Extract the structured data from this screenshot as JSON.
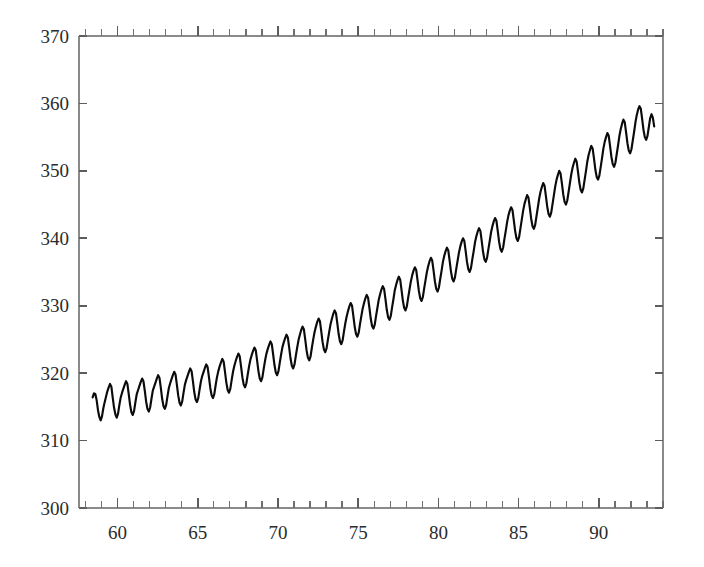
{
  "chart_data": {
    "type": "line",
    "title": "",
    "subtitle": "",
    "xlabel": "",
    "ylabel": "",
    "xlim": [
      57.6,
      94.0
    ],
    "ylim": [
      300,
      370
    ],
    "grid": false,
    "legend": null,
    "x_tick_labels": [
      "60",
      "65",
      "70",
      "75",
      "80",
      "85",
      "90"
    ],
    "x_tick_values": [
      60,
      65,
      70,
      75,
      80,
      85,
      90
    ],
    "x_minor_tick_step": 1,
    "y_tick_labels": [
      "300",
      "310",
      "320",
      "330",
      "340",
      "350",
      "360",
      "370"
    ],
    "y_tick_values": [
      300,
      310,
      320,
      330,
      340,
      350,
      360,
      370
    ],
    "series": [
      {
        "name": "atmospheric CO2 concentration",
        "color": "#0b0b0b",
        "x_start": 58.45,
        "x_end": 93.3,
        "x_step": 0.0833333,
        "values": [
          316.4,
          317.0,
          316.9,
          316.0,
          314.5,
          313.5,
          313.0,
          313.6,
          314.8,
          315.7,
          316.5,
          317.3,
          317.9,
          318.4,
          318.0,
          316.4,
          314.9,
          313.9,
          313.4,
          314.0,
          315.3,
          316.4,
          317.1,
          317.7,
          318.3,
          318.8,
          318.4,
          316.9,
          315.3,
          314.2,
          313.8,
          314.4,
          315.7,
          316.9,
          317.5,
          318.1,
          318.7,
          319.2,
          318.8,
          317.4,
          315.8,
          314.7,
          314.3,
          314.9,
          316.2,
          317.4,
          318.0,
          318.6,
          319.2,
          319.7,
          319.3,
          317.8,
          316.2,
          315.1,
          314.7,
          315.3,
          316.6,
          317.8,
          318.5,
          319.1,
          319.7,
          320.2,
          319.8,
          318.3,
          316.7,
          315.6,
          315.2,
          315.8,
          317.1,
          318.3,
          319.0,
          319.6,
          320.2,
          320.7,
          320.3,
          318.8,
          317.2,
          316.1,
          315.7,
          316.3,
          317.6,
          318.8,
          319.6,
          320.2,
          320.8,
          321.3,
          320.9,
          319.4,
          317.8,
          316.7,
          316.3,
          316.9,
          318.2,
          319.4,
          320.3,
          321.0,
          321.6,
          322.1,
          321.7,
          320.2,
          318.6,
          317.5,
          317.1,
          317.7,
          319.0,
          320.2,
          321.1,
          321.8,
          322.4,
          322.9,
          322.5,
          321.0,
          319.4,
          318.3,
          317.9,
          318.5,
          319.8,
          321.0,
          322.0,
          322.7,
          323.3,
          323.8,
          323.4,
          321.9,
          320.3,
          319.2,
          318.8,
          319.4,
          320.7,
          321.9,
          322.9,
          323.6,
          324.2,
          324.7,
          324.3,
          322.8,
          321.2,
          320.1,
          319.7,
          320.3,
          321.6,
          322.8,
          323.9,
          324.6,
          325.2,
          325.7,
          325.3,
          323.8,
          322.2,
          321.1,
          320.7,
          321.3,
          322.6,
          323.8,
          324.9,
          325.7,
          326.4,
          326.9,
          326.5,
          325.0,
          323.4,
          322.3,
          321.9,
          322.5,
          323.8,
          325.0,
          326.1,
          326.9,
          327.6,
          328.1,
          327.7,
          326.2,
          324.6,
          323.5,
          323.1,
          323.7,
          325.0,
          326.2,
          327.3,
          328.1,
          328.8,
          329.3,
          328.9,
          327.4,
          325.8,
          324.7,
          324.3,
          324.9,
          326.2,
          327.4,
          328.4,
          329.2,
          329.9,
          330.4,
          330.0,
          328.5,
          326.9,
          325.8,
          325.4,
          326.0,
          327.3,
          328.5,
          329.6,
          330.4,
          331.1,
          331.6,
          331.2,
          329.7,
          328.1,
          327.0,
          326.6,
          327.2,
          328.5,
          329.7,
          330.9,
          331.7,
          332.4,
          332.9,
          332.5,
          331.0,
          329.4,
          328.3,
          327.9,
          328.5,
          329.8,
          331.0,
          332.3,
          333.1,
          333.8,
          334.3,
          333.9,
          332.4,
          330.8,
          329.7,
          329.3,
          329.9,
          331.2,
          332.4,
          333.6,
          334.5,
          335.2,
          335.7,
          335.3,
          333.8,
          332.2,
          331.1,
          330.7,
          331.3,
          332.6,
          333.8,
          335.0,
          335.9,
          336.6,
          337.1,
          336.7,
          335.2,
          333.6,
          332.5,
          332.1,
          332.7,
          334.0,
          335.2,
          336.5,
          337.4,
          338.1,
          338.6,
          338.2,
          336.7,
          335.1,
          334.0,
          333.6,
          334.2,
          335.5,
          336.7,
          337.9,
          338.8,
          339.5,
          340.0,
          339.6,
          338.1,
          336.5,
          335.4,
          335.0,
          335.6,
          336.9,
          338.1,
          339.4,
          340.3,
          341.0,
          341.5,
          341.1,
          339.6,
          338.0,
          336.9,
          336.5,
          337.1,
          338.4,
          339.6,
          340.9,
          341.8,
          342.5,
          343.0,
          342.6,
          341.1,
          339.5,
          338.4,
          338.0,
          338.6,
          339.9,
          341.1,
          342.4,
          343.4,
          344.1,
          344.6,
          344.2,
          342.7,
          341.1,
          340.0,
          339.6,
          340.2,
          341.5,
          342.8,
          344.1,
          345.1,
          345.8,
          346.4,
          346.0,
          344.5,
          342.9,
          341.8,
          341.4,
          342.0,
          343.3,
          344.6,
          345.9,
          346.9,
          347.6,
          348.2,
          347.8,
          346.3,
          344.7,
          343.6,
          343.2,
          343.8,
          345.1,
          346.4,
          347.7,
          348.7,
          349.4,
          350.0,
          349.6,
          348.1,
          346.5,
          345.4,
          345.0,
          345.6,
          346.9,
          348.2,
          349.5,
          350.5,
          351.2,
          351.8,
          351.4,
          349.9,
          348.3,
          347.2,
          346.8,
          347.4,
          348.7,
          350.0,
          351.4,
          352.4,
          353.1,
          353.7,
          353.3,
          351.8,
          350.2,
          349.1,
          348.7,
          349.3,
          350.6,
          351.9,
          353.3,
          354.3,
          355.0,
          355.6,
          355.2,
          353.7,
          352.1,
          351.0,
          350.6,
          351.2,
          352.5,
          353.8,
          355.2,
          356.2,
          357.0,
          357.6,
          357.2,
          355.7,
          354.1,
          353.0,
          352.6,
          353.2,
          354.5,
          355.8,
          357.2,
          358.3,
          359.1,
          359.6,
          359.2,
          357.7,
          356.1,
          355.0,
          354.6,
          355.2,
          356.5,
          357.8,
          358.4,
          357.9,
          356.6
        ]
      }
    ]
  }
}
